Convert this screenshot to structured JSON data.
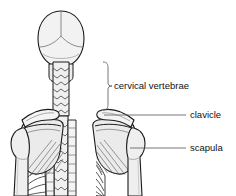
{
  "figure": {
    "background_color": "#ffffff",
    "outline_color": "#1a1a1a",
    "bone_fill": "#f2f2f2",
    "bone_fill_shaded": "#e4e4e4",
    "leader_color": "#666666",
    "label_color": "#111111"
  },
  "labels": [
    {
      "id": "cervical-vertebrae",
      "text": "cervical vertebrae",
      "x": 114,
      "y": 86,
      "connector": "bracket"
    },
    {
      "id": "clavicle",
      "text": "clavicle",
      "x": 190,
      "y": 115,
      "connector": "line"
    },
    {
      "id": "scapula",
      "text": "scapula",
      "x": 190,
      "y": 148,
      "connector": "line"
    }
  ],
  "structures": [
    {
      "id": "skull",
      "name": "skull"
    },
    {
      "id": "cervical-spine",
      "name": "cervical vertebrae"
    },
    {
      "id": "thoracic-spine",
      "name": "thoracic vertebrae"
    },
    {
      "id": "clavicle-left",
      "name": "left clavicle"
    },
    {
      "id": "clavicle-right",
      "name": "right clavicle"
    },
    {
      "id": "scapula-left",
      "name": "left scapula"
    },
    {
      "id": "scapula-right",
      "name": "right scapula"
    },
    {
      "id": "humerus-left",
      "name": "left humerus"
    },
    {
      "id": "humerus-right",
      "name": "right humerus"
    },
    {
      "id": "ribs-left",
      "name": "left ribs"
    },
    {
      "id": "ribs-right",
      "name": "right ribs"
    }
  ]
}
